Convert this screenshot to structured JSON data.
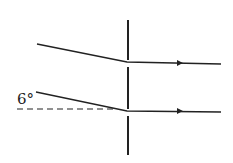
{
  "diagram": {
    "type": "optics-ray-diagram",
    "angle_label": "6°",
    "colors": {
      "line": "#222222",
      "background": "#ffffff"
    },
    "lens": {
      "x": 128,
      "segments": [
        [
          20,
          60
        ],
        [
          67,
          109
        ],
        [
          116,
          155
        ]
      ]
    },
    "rays": [
      {
        "name": "upper-ray",
        "incident": [
          [
            37,
            44
          ],
          [
            127,
            62
          ]
        ],
        "refracted": [
          [
            127,
            62
          ],
          [
            221,
            64
          ]
        ],
        "arrow_x": 180
      },
      {
        "name": "lower-ray",
        "incident": [
          [
            36,
            92
          ],
          [
            127,
            111
          ]
        ],
        "refracted": [
          [
            127,
            111
          ],
          [
            221,
            112
          ]
        ],
        "arrow_x": 180
      }
    ],
    "reference_line": {
      "style": "dashed",
      "from": [
        17,
        109
      ],
      "to": [
        115,
        109
      ]
    }
  }
}
